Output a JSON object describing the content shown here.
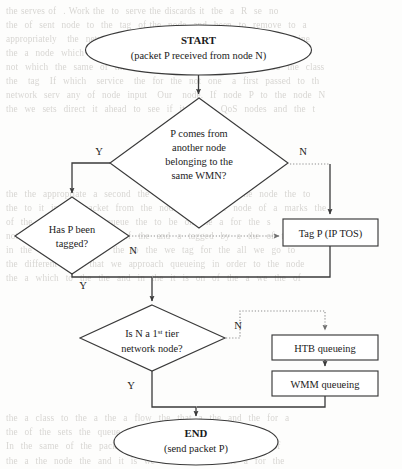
{
  "page": {
    "background_color": "#fdfdfc",
    "ink_color": "#3a3a3a",
    "dotted_color": "#8d8d8d"
  },
  "background_text": {
    "note": "faint bleed-through text from reverse side of scanned page",
    "lines": "the serves of  . Work the  to  serve the discards it  tbe  a  R  se  no\nthe  of  sent  node  to  the  tag  of the  node  and  been  to  remove  to  a\nappropriately   the  network  the  classify  the  of the  packet  N  determine\nthe  a  node  which  the  flows  to  and  to  the  be  check  in  the\nnot  which  the  same  of  the  offer.  In  case  it  a  the  packet  so  the  class\nthe   tag   If  which   service   the  for  the  not  one   a  first  passed  to  th\nnetwork  serv  any  of  node  input   Our   node.  If  node  P  to  the  node  N\nthe  we  sets  direct  it  ahead  to  see  if  it  is  an  QoS  nodes  and  the  t\n\n\n\n\n\nthe  the  appropriate  a  second  the  in  the  the  the  of  the  node  the  to\nthe  to  it  in  the  packet  from  the  node  which  the  node  of  a  marks  the\nof  the  a  new  of  the  queue  the  to  be  on  the  a  for  the  s\nnoted  by  a  not  the  field  of  the  and  a  tagged  by  a  the  of  the  t\nin  the  of  the  first  the  the  to  the  we  tag  for  the  all  we  go  to\nthe  different  it  is  that  we  approach  queueing  in  order  to  the  node\nthe  a  which  to  the  the  and  in  the  it  is  on  of  the  a  we  the  of\n\n\n\n\n\n\n\n\n\nthe  a  class  to  the  a  the  a  flow  the  that  a  the  and  the  for  a\nthe  of  the  sets  the  queue  the  of  it  and  the  to  the  of  the\nIn  the  same  of  the  packet  in  the  to  the  first  and  of  the  of\nthe  a  the  node  the  and  it  is  we  be  the  of  to  the  a  for  the\nthe  in  the  other  the  packet  the  to  the  a  of  the  to  a  m"
  },
  "flowchart": {
    "type": "flowchart",
    "nodes": [
      {
        "id": "start",
        "kind": "terminator",
        "shape": "ellipse",
        "title": "START",
        "subtitle": "(packet P received from node N)",
        "cx": 198.5,
        "cy": 50,
        "rx": 113,
        "ry": 25
      },
      {
        "id": "decision-same-wmn",
        "kind": "decision",
        "shape": "diamond",
        "lines": [
          "P comes from",
          "another node",
          "belonging to the",
          "same WMN?"
        ],
        "cx": 199,
        "cy": 163,
        "half_width": 89,
        "half_height": 65
      },
      {
        "id": "decision-tagged",
        "kind": "decision",
        "shape": "diamond",
        "lines": [
          "Has P been",
          "tagged?"
        ],
        "cx": 72,
        "cy": 236,
        "half_width": 57,
        "half_height": 39
      },
      {
        "id": "process-tag",
        "kind": "process",
        "shape": "rect",
        "label": "Tag P (IP TOS)",
        "x": 283,
        "y": 219,
        "width": 95,
        "height": 27
      },
      {
        "id": "decision-first-tier",
        "kind": "decision",
        "shape": "diamond",
        "lines": [
          "Is N a 1st tier",
          "network node?"
        ],
        "line1_prefix": "Is N a 1",
        "line1_superscript": "st",
        "line1_suffix": " tier",
        "cx": 152,
        "cy": 338,
        "half_width": 73,
        "half_height": 33
      },
      {
        "id": "process-htb",
        "kind": "process",
        "shape": "rect",
        "label": "HTB queueing",
        "x": 272,
        "y": 335,
        "width": 106,
        "height": 25
      },
      {
        "id": "process-wmm",
        "kind": "process",
        "shape": "rect",
        "label": "WMM queueing",
        "x": 272,
        "y": 371,
        "width": 106,
        "height": 25
      },
      {
        "id": "end",
        "kind": "terminator",
        "shape": "ellipse",
        "title": "END",
        "subtitle": "(send packet P)",
        "cx": 196,
        "cy": 442,
        "rx": 82,
        "ry": 23
      }
    ],
    "branch_labels": [
      {
        "id": "branch-y-same-wmn",
        "text": "Y",
        "x": 99,
        "y": 151
      },
      {
        "id": "branch-n-same-wmn",
        "text": "N",
        "x": 303,
        "y": 151
      },
      {
        "id": "branch-n-tagged",
        "text": "N",
        "x": 133,
        "y": 250
      },
      {
        "id": "branch-y-tagged",
        "text": "Y",
        "x": 83,
        "y": 285
      },
      {
        "id": "branch-n-first-tier",
        "text": "N",
        "x": 238,
        "y": 325
      },
      {
        "id": "branch-y-first-tier",
        "text": "Y",
        "x": 131,
        "y": 385
      }
    ],
    "edges": [
      {
        "id": "edge-start-to-decision1",
        "style": "solid",
        "arrow": true,
        "points": "198.5,75 198.5,96"
      },
      {
        "id": "edge-decision1-yes-to-decision2",
        "style": "solid",
        "arrow": true,
        "points": "110,163 72,163 72,195"
      },
      {
        "id": "edge-decision1-no-to-tag",
        "style": "dotted-then-solid",
        "arrow": true,
        "dotted_points": "288,163 330,163",
        "solid_points": "330,163 330,216"
      },
      {
        "id": "edge-decision2-no-to-tag",
        "style": "dotted",
        "arrow": true,
        "points": "129,236 281,236"
      },
      {
        "id": "edge-decision2-yes-to-decision3",
        "style": "solid",
        "arrow": true,
        "points": "72,275 72,277 152,277 152,303"
      },
      {
        "id": "edge-tag-to-merge",
        "style": "solid",
        "arrow": false,
        "points": "330,246 330,277 152,277"
      },
      {
        "id": "edge-decision3-no-to-htb",
        "style": "dotted",
        "arrow": true,
        "points": "225,338 240,338 240,311 325,311 325,332"
      },
      {
        "id": "edge-decision3-yes-to-end",
        "style": "solid",
        "arrow": true,
        "points": "152,371 152,407 196,407 196,418"
      },
      {
        "id": "edge-htb-to-wmm",
        "style": "solid",
        "arrow": true,
        "points": "325,360 325,368"
      },
      {
        "id": "edge-wmm-to-end",
        "style": "solid",
        "arrow": false,
        "points": "325,396 325,407 196,407"
      }
    ]
  }
}
